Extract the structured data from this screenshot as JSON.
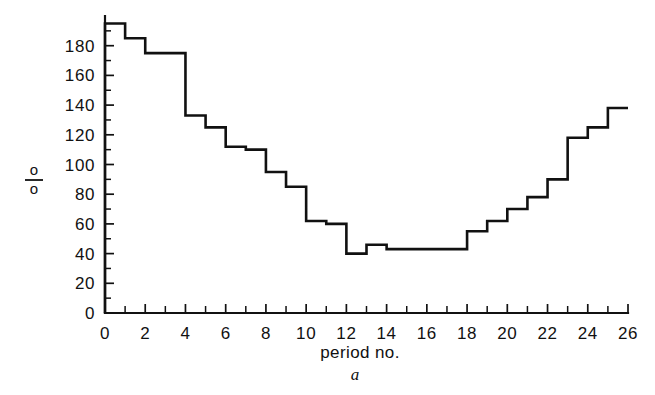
{
  "chart_data": {
    "type": "line",
    "subtype": "step-post",
    "title": "",
    "xlabel": "period no.",
    "ylabel": "%",
    "caption": "a",
    "xlim": [
      0,
      26
    ],
    "ylim": [
      0,
      200
    ],
    "xtick_step": 2,
    "xtick_minor_step": 1,
    "ytick_step": 20,
    "ytick_minor_step": 10,
    "grid": false,
    "legend": null,
    "xticklabels": [
      "0",
      "2",
      "4",
      "6",
      "8",
      "10",
      "12",
      "14",
      "16",
      "18",
      "20",
      "22",
      "24",
      "26"
    ],
    "yticklabels": [
      "0",
      "20",
      "40",
      "60",
      "80",
      "100",
      "120",
      "140",
      "160",
      "180"
    ],
    "x": [
      0,
      1,
      2,
      3,
      4,
      5,
      6,
      7,
      8,
      9,
      10,
      11,
      12,
      13,
      14,
      15,
      16,
      17,
      18,
      19,
      20,
      21,
      22,
      23,
      24,
      25,
      26
    ],
    "values": [
      195,
      185,
      175,
      175,
      175,
      133,
      125,
      112,
      110,
      95,
      85,
      62,
      60,
      40,
      46,
      43,
      43,
      43,
      43,
      43,
      57,
      65,
      72,
      78,
      88,
      95,
      105
    ],
    "series": [
      {
        "name": "percentage by period",
        "values": [
          195,
          185,
          175,
          175,
          175,
          133,
          125,
          112,
          110,
          95,
          85,
          62,
          60,
          40,
          46,
          43,
          43,
          43,
          43,
          43,
          57,
          65,
          72,
          78,
          88,
          95,
          105
        ]
      }
    ],
    "steps": [
      {
        "period_start": 0,
        "period_end": 1,
        "value": 195
      },
      {
        "period_start": 1,
        "period_end": 2,
        "value": 185
      },
      {
        "period_start": 2,
        "period_end": 3,
        "value": 175
      },
      {
        "period_start": 3,
        "period_end": 4,
        "value": 175
      },
      {
        "period_start": 4,
        "period_end": 5,
        "value": 133
      },
      {
        "period_start": 5,
        "period_end": 6,
        "value": 125
      },
      {
        "period_start": 6,
        "period_end": 7,
        "value": 112
      },
      {
        "period_start": 7,
        "period_end": 8,
        "value": 110
      },
      {
        "period_start": 8,
        "period_end": 9,
        "value": 95
      },
      {
        "period_start": 9,
        "period_end": 10,
        "value": 85
      },
      {
        "period_start": 10,
        "period_end": 11,
        "value": 62
      },
      {
        "period_start": 11,
        "period_end": 12,
        "value": 60
      },
      {
        "period_start": 12,
        "period_end": 13,
        "value": 40
      },
      {
        "period_start": 13,
        "period_end": 14,
        "value": 46
      },
      {
        "period_start": 14,
        "period_end": 15,
        "value": 43
      },
      {
        "period_start": 15,
        "period_end": 16,
        "value": 43
      },
      {
        "period_start": 16,
        "period_end": 17,
        "value": 43
      },
      {
        "period_start": 17,
        "period_end": 18,
        "value": 43
      },
      {
        "period_start": 18,
        "period_end": 19,
        "value": 55
      },
      {
        "period_start": 19,
        "period_end": 20,
        "value": 62
      },
      {
        "period_start": 20,
        "period_end": 21,
        "value": 70
      },
      {
        "period_start": 21,
        "period_end": 22,
        "value": 78
      },
      {
        "period_start": 22,
        "period_end": 23,
        "value": 90
      },
      {
        "period_start": 23,
        "period_end": 24,
        "value": 118
      },
      {
        "period_start": 24,
        "period_end": 25,
        "value": 125
      },
      {
        "period_start": 25,
        "period_end": 26,
        "value": 138
      }
    ],
    "colors": {
      "line": "#111111",
      "axis": "#111111",
      "background": "#ffffff"
    }
  }
}
